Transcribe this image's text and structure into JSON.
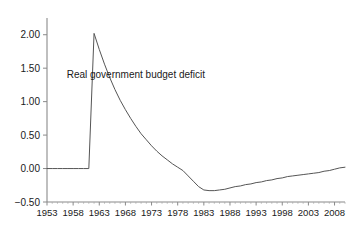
{
  "chart_data": {
    "type": "line",
    "title": "",
    "xlabel": "",
    "ylabel": "",
    "xlim": [
      1953,
      2010
    ],
    "ylim": [
      -0.5,
      2.25
    ],
    "grid": false,
    "legend_position": "none",
    "annotations": [
      {
        "text": "Real government budget deficit",
        "x": 1970,
        "y": 1.36
      }
    ],
    "xticks": [
      1953,
      1958,
      1963,
      1968,
      1973,
      1978,
      1983,
      1988,
      1993,
      1998,
      2003,
      2008
    ],
    "xtick_labels": [
      "1953",
      "1958",
      "1963",
      "1968",
      "1973",
      "1978",
      "1983",
      "1988",
      "1993",
      "1998",
      "2003",
      "2008"
    ],
    "yticks": [
      -0.5,
      0,
      0.5,
      1,
      1.5,
      2
    ],
    "ytick_labels": [
      "-0.50",
      "0.00",
      "0.50",
      "1.00",
      "1.50",
      "2.00"
    ],
    "series": [
      {
        "name": "Real government budget deficit",
        "color": "#555555",
        "x": [
          1953,
          1954,
          1955,
          1956,
          1957,
          1958,
          1959,
          1960,
          1961,
          1962,
          1963,
          1964,
          1965,
          1966,
          1967,
          1968,
          1969,
          1970,
          1971,
          1972,
          1973,
          1974,
          1975,
          1976,
          1977,
          1978,
          1979,
          1980,
          1981,
          1982,
          1983,
          1984,
          1985,
          1986,
          1987,
          1988,
          1989,
          1990,
          1991,
          1992,
          1993,
          1994,
          1995,
          1996,
          1997,
          1998,
          1999,
          2000,
          2001,
          2002,
          2003,
          2004,
          2005,
          2006,
          2007,
          2008,
          2009,
          2010
        ],
        "y": [
          0,
          0,
          0,
          0,
          0,
          0,
          0,
          0,
          0,
          2.02,
          1.78,
          1.56,
          1.36,
          1.18,
          1.02,
          0.88,
          0.75,
          0.63,
          0.52,
          0.43,
          0.34,
          0.26,
          0.19,
          0.13,
          0.07,
          0.02,
          -0.03,
          -0.11,
          -0.19,
          -0.27,
          -0.32,
          -0.33,
          -0.33,
          -0.32,
          -0.31,
          -0.29,
          -0.27,
          -0.26,
          -0.24,
          -0.23,
          -0.21,
          -0.2,
          -0.18,
          -0.17,
          -0.15,
          -0.14,
          -0.12,
          -0.11,
          -0.1,
          -0.09,
          -0.08,
          -0.07,
          -0.06,
          -0.04,
          -0.03,
          -0.01,
          0.01,
          0.02
        ]
      }
    ]
  },
  "figure": {
    "background_color": "#ffffff",
    "axis_color": "#8a8a8a",
    "text_color": "#1a1a1a"
  }
}
